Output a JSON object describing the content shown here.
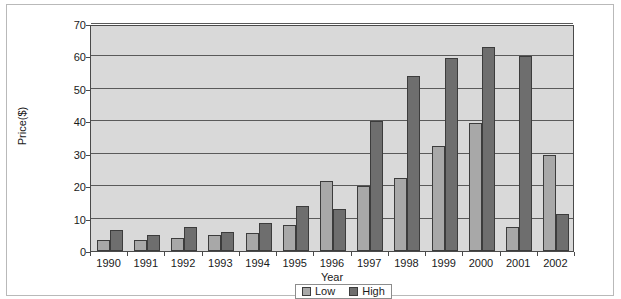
{
  "chart_data": {
    "type": "bar",
    "title": "",
    "xlabel": "Year",
    "ylabel": "Price($)",
    "categories": [
      "1990",
      "1991",
      "1992",
      "1993",
      "1994",
      "1995",
      "1996",
      "1997",
      "1998",
      "1999",
      "2000",
      "2001",
      "2002"
    ],
    "series": [
      {
        "name": "Low",
        "color": "#a8a8a8",
        "values": [
          3.5,
          3.5,
          4,
          5,
          5.5,
          8,
          21.5,
          20,
          22.5,
          32.5,
          39.5,
          7.5,
          29.5
        ]
      },
      {
        "name": "High",
        "color": "#6e6e6e",
        "values": [
          6.5,
          5,
          7.5,
          6,
          8.5,
          14,
          13,
          40,
          54,
          59.5,
          63,
          60,
          11.5
        ]
      }
    ],
    "ylim": [
      0,
      70
    ],
    "yticks": [
      0,
      10,
      20,
      30,
      40,
      50,
      60,
      70
    ],
    "ytick_labels": [
      "0",
      "10",
      "20",
      "30",
      "40",
      "50",
      "60",
      "70"
    ],
    "grid": true,
    "legend_position": "bottom",
    "plot_background": "#d9d9d9",
    "axis_color": "#4a4a4a"
  },
  "legend": {
    "items": [
      {
        "label": "Low",
        "color": "#a8a8a8"
      },
      {
        "label": "High",
        "color": "#6e6e6e"
      }
    ]
  }
}
